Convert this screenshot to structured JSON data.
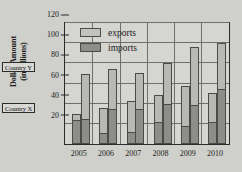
{
  "chart_data": {
    "type": "bar",
    "title": "",
    "xlabel": "",
    "ylabel": "Dollar Amount (in billions)",
    "ylabel_line1": "Dollar Amount",
    "ylabel_line2": "(in billions)",
    "categories": [
      "2005",
      "2006",
      "2007",
      "2008",
      "2009",
      "2010"
    ],
    "ylim": [
      0,
      120
    ],
    "yticks": [
      20,
      40,
      60,
      80,
      100,
      120
    ],
    "grid": true,
    "legend": [
      "exports",
      "imports"
    ],
    "legend_position": "top-left-inside",
    "annotations": [
      "Country X",
      "Country Y"
    ],
    "series": [
      {
        "name": "Country X exports",
        "country": "Country X",
        "kind": "exports",
        "values": [
          30,
          36,
          43,
          49,
          58,
          51
        ]
      },
      {
        "name": "Country X imports",
        "country": "Country X",
        "kind": "imports",
        "values": [
          26,
          12,
          13,
          23,
          18,
          23
        ]
      },
      {
        "name": "Country Y exports",
        "country": "Country Y",
        "kind": "exports",
        "values": [
          69,
          74,
          70,
          80,
          96,
          100
        ]
      },
      {
        "name": "Country Y imports",
        "country": "Country Y",
        "kind": "imports",
        "values": [
          26,
          36,
          36,
          41,
          40,
          56
        ]
      }
    ]
  },
  "legend": {
    "exports_label": "exports",
    "imports_label": "imports"
  },
  "callouts": {
    "country_y": "Country Y",
    "country_x": "Country X"
  },
  "colors": {
    "exports": "#b8b8b4",
    "imports": "#8d8d89",
    "axis": "#2b2b2b",
    "grid": "#6f6f6c",
    "background": "#cfcfcb",
    "plot_background": "#d5d5d1"
  }
}
